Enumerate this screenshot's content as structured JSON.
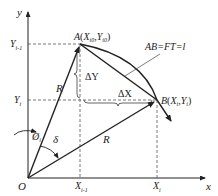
{
  "diagram": {
    "axes": {
      "x_label": "x",
      "y_label": "y",
      "origin_label": "O"
    },
    "ticks": {
      "y_upper": {
        "base": "Y",
        "sub": "i-1"
      },
      "y_lower": {
        "base": "Y",
        "sub": "i"
      },
      "x_left": {
        "base": "X",
        "sub": "i-1"
      },
      "x_right": {
        "base": "X",
        "sub": "i"
      }
    },
    "points": {
      "A": {
        "name": "A",
        "x": "X",
        "x_sub": "i0",
        "y": "Y",
        "y_sub": "i0"
      },
      "B": {
        "name": "B",
        "x": "X",
        "x_sub": "i",
        "y": "Y",
        "y_sub": "i"
      }
    },
    "annotations": {
      "chord": "AB=FT=l",
      "radius_a": "R",
      "radius_b": "R",
      "delta_y": "ΔY",
      "delta_x": "ΔX",
      "angle_phi": "Ø",
      "angle_phi_sub": "i",
      "angle_delta": "δ"
    },
    "colors": {
      "line": "#222222",
      "dash": "#555555",
      "background": "#ffffff"
    }
  }
}
